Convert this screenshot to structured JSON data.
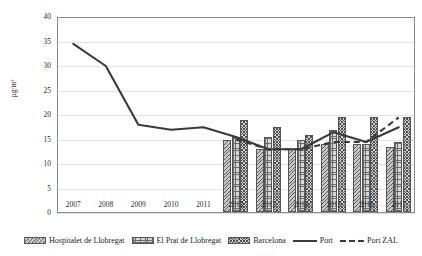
{
  "chart_data": {
    "type": "bar",
    "title": "",
    "subtitle": "",
    "xlabel": "",
    "ylabel": "µg/m³",
    "categories": [
      "2007",
      "2008",
      "2009",
      "2010",
      "2011",
      "2012",
      "2013",
      "2014",
      "2015",
      "2016",
      "2017"
    ],
    "ylim": [
      0,
      40
    ],
    "yticks": [
      0,
      5,
      10,
      15,
      20,
      25,
      30,
      35,
      40
    ],
    "grid": true,
    "legend_position": "bottom",
    "bar_series": [
      {
        "name": "Hospitalet de Llobregat",
        "kind": "bar",
        "pattern": "diagonal-hatch",
        "color": "#c9c9c9",
        "values": [
          null,
          null,
          null,
          null,
          null,
          15.0,
          13.0,
          13.0,
          14.0,
          14.0,
          13.5
        ]
      },
      {
        "name": "El Prat de Llobregat",
        "kind": "bar",
        "pattern": "grid-hatch",
        "color": "#d8d8d8",
        "values": [
          null,
          null,
          null,
          null,
          null,
          15.5,
          15.5,
          15.0,
          17.0,
          14.0,
          14.5
        ]
      },
      {
        "name": "Barcelona",
        "kind": "bar",
        "pattern": "cross-hatch",
        "color": "#cfcfcf",
        "values": [
          null,
          null,
          null,
          null,
          null,
          19.0,
          17.5,
          16.0,
          19.5,
          19.5,
          19.5
        ]
      }
    ],
    "line_series": [
      {
        "name": "Port",
        "kind": "line",
        "style": "solid",
        "color": "#3a3a3a",
        "values": [
          34.5,
          30.0,
          18.0,
          17.0,
          17.5,
          15.5,
          13.0,
          13.0,
          16.5,
          14.5,
          17.5
        ]
      },
      {
        "name": "Port ZAL",
        "kind": "line",
        "style": "dashed",
        "color": "#3a3a3a",
        "values": [
          null,
          null,
          null,
          null,
          null,
          15.0,
          13.0,
          13.0,
          14.5,
          14.5,
          19.5
        ]
      }
    ]
  },
  "axis": {
    "y_tick_labels": [
      "40",
      "35",
      "30",
      "25",
      "20",
      "15",
      "10",
      "5",
      "0"
    ],
    "x_tick_labels": [
      "2007",
      "2008",
      "2009",
      "2010",
      "2011",
      "2012",
      "2013",
      "2014",
      "2015",
      "2016",
      "2017"
    ],
    "y_axis_title": "µg/m³"
  },
  "legend": {
    "items": [
      {
        "label": "Hospitalet de Llobregat",
        "marker": "bar-diagonal-hatch-swatch"
      },
      {
        "label": "El Prat de Llobregat",
        "marker": "bar-grid-hatch-swatch"
      },
      {
        "label": "Barcelona",
        "marker": "bar-cross-hatch-swatch"
      },
      {
        "label": "Port",
        "marker": "solid-line-swatch"
      },
      {
        "label": "Port ZAL",
        "marker": "dashed-line-swatch"
      }
    ]
  }
}
